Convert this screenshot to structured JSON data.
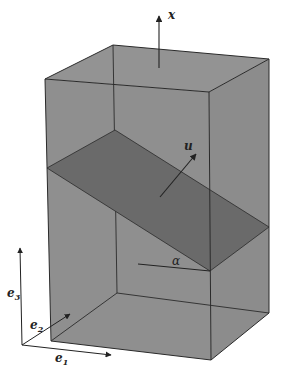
{
  "diagram": {
    "colors": {
      "box_fill": "#8f8f8f",
      "plane_fill": "#6a6a6a",
      "edge": "#2a2a2a",
      "background": "#ffffff"
    },
    "labels": {
      "x": "x",
      "u": "u",
      "alpha": "α",
      "e1": "e",
      "e1_sub": "1",
      "e2": "e",
      "e2_sub": "2",
      "e3": "e",
      "e3_sub": "3"
    }
  }
}
